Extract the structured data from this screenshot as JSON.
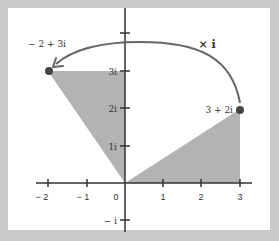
{
  "diagram": {
    "points": [
      {
        "label": "3 + 2i",
        "re": 3,
        "im": 2
      },
      {
        "label": "− 2 + 3i",
        "re": -2,
        "im": 3
      }
    ],
    "operation_label": "× i",
    "x_ticks": [
      "− 2",
      "− 1",
      "0",
      "1",
      "2",
      "3"
    ],
    "y_ticks": [
      "3i",
      "2i",
      "1i",
      "− i"
    ],
    "colors": {
      "background": "#c9c9c9",
      "panel": "#ffffff",
      "shade": "#b3b3b3",
      "axis": "#333333",
      "arc": "#666666",
      "point": "#444444"
    }
  }
}
